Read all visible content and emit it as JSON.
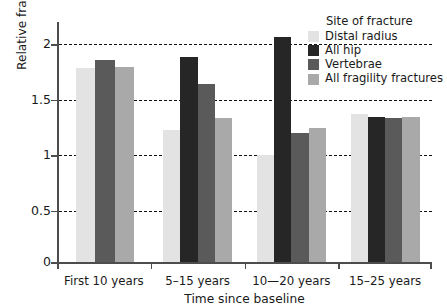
{
  "chart_data": {
    "type": "bar",
    "title": "",
    "xlabel": "Time since baseline",
    "ylabel": "Relative fracture risk per 1SD reduction in BMD",
    "ylim": [
      0,
      2.15
    ],
    "yticks": [
      "0",
      "0.5",
      "1",
      "1.5",
      "2"
    ],
    "ytick_values": [
      0,
      0.5,
      1,
      1.5,
      2
    ],
    "grid": "horizontal dashed gridlines at 0.5, 1, 1.5, 2",
    "legend_position": "top-right",
    "legend_title": "Site of fracture",
    "categories": [
      "First 10 years",
      "5–15 years",
      "10—20 years",
      "15–25 years"
    ],
    "series": [
      {
        "name": "Distal radius",
        "color": "#e3e3e3",
        "values": [
          1.75,
          1.19,
          0.96,
          1.33
        ]
      },
      {
        "name": "All hip",
        "color": "#262626",
        "values": [
          null,
          1.85,
          2.03,
          1.31
        ]
      },
      {
        "name": "Vertebrae",
        "color": "#5a5a5a",
        "values": [
          1.82,
          1.6,
          1.16,
          1.3
        ]
      },
      {
        "name": "All fragility fractures",
        "color": "#a9a9a9",
        "values": [
          1.76,
          1.3,
          1.21,
          1.31
        ]
      }
    ]
  },
  "axes": {
    "y_title": "Relative fracture risk per 1SD reduction in BMD",
    "x_title": "Time since baseline"
  },
  "legend": {
    "title": "Site of fracture",
    "items": [
      {
        "label": "Distal radius",
        "color": "#e3e3e3"
      },
      {
        "label": "All hip",
        "color": "#262626"
      },
      {
        "label": "Vertebrae",
        "color": "#5a5a5a"
      },
      {
        "label": "All fragility fractures",
        "color": "#a9a9a9"
      }
    ]
  }
}
